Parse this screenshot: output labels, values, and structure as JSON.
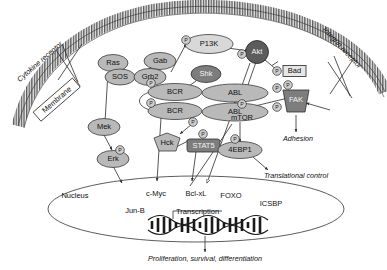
{
  "figure": {
    "membrane_label": "Membrane",
    "receptors": {
      "cytokine": "Cytokine receptor",
      "integrin": "Integrin receptor"
    },
    "phospho_label": "P"
  },
  "nodes": {
    "pi3k": "P13K",
    "akt": "Akt",
    "bad": "Bad",
    "ras": "Ras",
    "gab": "Gab",
    "sos": "SOS",
    "grb2": "Grb2",
    "shk": "Shk",
    "bcr_top": "BCR",
    "bcr_bottom": "BCR",
    "abl_top": "ABL",
    "abl_bottom": "ABL",
    "hck": "Hck",
    "stat5": "STAT5",
    "mek": "Mek",
    "erk": "Erk",
    "mtor": "mTOR",
    "fak": "FAK",
    "ebp1": "4EBP1"
  },
  "nucleus": {
    "label": "Nucleus",
    "targets": [
      "c-Myc",
      "Jun-B",
      "Bcl-xL",
      "FOXO",
      "ICSBP"
    ],
    "transcription_label": "Transcription"
  },
  "outcomes": {
    "adhesion": "Adhesion",
    "translational_control": "Translational control",
    "bottom": "Proliferation, survival, differentiation"
  },
  "colors": {
    "node_mid": "#b9b9b9",
    "node_light": "#d8d8d8",
    "node_dark": "#7d7d7d",
    "node_very_dark": "#5c5c5c",
    "stroke": "#2b2b2b",
    "background": "#ffffff",
    "membrane": "#4f4f4f"
  }
}
